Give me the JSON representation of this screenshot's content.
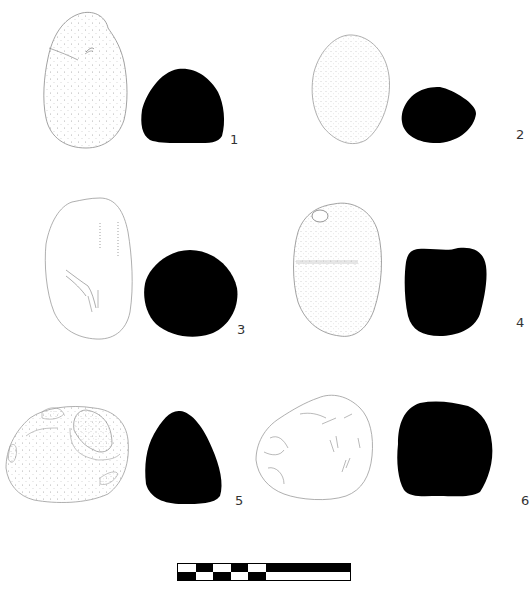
{
  "plate": {
    "figures": [
      {
        "number": "1",
        "label_pos": [
          230,
          136
        ]
      },
      {
        "number": "2",
        "label_pos": [
          516,
          131
        ]
      },
      {
        "number": "3",
        "label_pos": [
          237,
          326
        ]
      },
      {
        "number": "4",
        "label_pos": [
          516,
          319
        ]
      },
      {
        "number": "5",
        "label_pos": [
          235,
          497
        ]
      },
      {
        "number": "6",
        "label_pos": [
          521,
          497
        ]
      }
    ],
    "scale_bar": {
      "top_row": [
        "white",
        "black",
        "white",
        "black",
        "white",
        "black-long"
      ],
      "bottom_row": [
        "black",
        "white",
        "black",
        "white",
        "black",
        "white-long"
      ]
    },
    "colors": {
      "section_fill": "#000000",
      "outline": "#8a8a8a",
      "background": "#ffffff"
    }
  }
}
